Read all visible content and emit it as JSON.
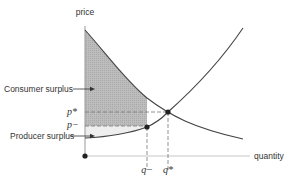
{
  "diagram": {
    "type": "supply-demand",
    "axes": {
      "y_label": "price",
      "x_label": "quantity"
    },
    "annotations": {
      "consumer_surplus": "Consumer surplus",
      "producer_surplus": "Producer surplus"
    },
    "price_ticks": {
      "p_star": "p*",
      "p_minus": "p−"
    },
    "quantity_ticks": {
      "q_minus": "q−",
      "q_star": "q*"
    },
    "curves": [
      {
        "name": "demand",
        "shape": "downward-sloping convex"
      },
      {
        "name": "supply",
        "shape": "upward-sloping convex"
      }
    ],
    "points": [
      {
        "name": "equilibrium",
        "at": "(q*, p*)"
      },
      {
        "name": "restricted-quantity point",
        "at": "(q−, p−)"
      },
      {
        "name": "origin"
      }
    ],
    "colors": {
      "curve": "#444444",
      "consumer_surplus_fill": "#b8b8b8",
      "producer_surplus_fill": "#ececec",
      "dashed_guides": "#777777",
      "axis": "#bbbbbb"
    }
  }
}
